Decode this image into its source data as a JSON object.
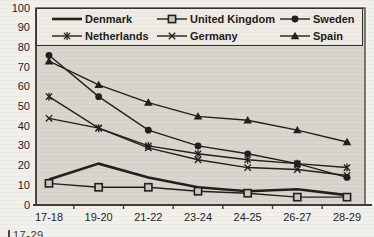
{
  "chart_data": {
    "type": "line",
    "title": "",
    "xlabel": "",
    "ylabel": "",
    "categories": [
      "17-18",
      "19-20",
      "21-22",
      "23-24",
      "24-25",
      "26-27",
      "28-29"
    ],
    "series": [
      {
        "name": "Denmark",
        "marker": "none",
        "values": [
          13,
          21,
          14,
          9,
          7,
          8,
          5
        ]
      },
      {
        "name": "United Kingdom",
        "marker": "square-open",
        "values": [
          11,
          9,
          9,
          7,
          6,
          4,
          4
        ]
      },
      {
        "name": "Sweden",
        "marker": "circle-filled",
        "values": [
          76,
          55,
          38,
          30,
          26,
          21,
          14
        ]
      },
      {
        "name": "Netherlands",
        "marker": "asterisk",
        "values": [
          55,
          39,
          30,
          26,
          23,
          21,
          19
        ]
      },
      {
        "name": "Germany",
        "marker": "x",
        "values": [
          44,
          39,
          29,
          23,
          19,
          18,
          15
        ]
      },
      {
        "name": "Spain",
        "marker": "triangle-filled",
        "values": [
          73,
          61,
          52,
          45,
          43,
          38,
          32
        ]
      }
    ],
    "ylim": [
      0,
      100
    ],
    "yticks": [
      0,
      10,
      20,
      30,
      40,
      50,
      60,
      70,
      80,
      90,
      100
    ],
    "grid": false,
    "legend_position": "top-box",
    "legend_rows": [
      [
        "Denmark",
        "United Kingdom",
        "Sweden"
      ],
      [
        "Netherlands",
        "Germany",
        "Spain"
      ]
    ],
    "colors": {
      "line": "#201f1c",
      "plot_bg": "#d7d5ce",
      "legend_bg": "#edebe4",
      "page_bg": "#f1f0eb",
      "frame": "#3c3b36",
      "square_fill": "#c9c7c0"
    }
  },
  "caption_fragment": "17-29"
}
